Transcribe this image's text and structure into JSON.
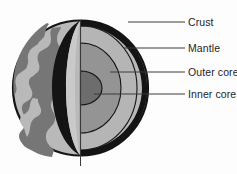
{
  "figure": {
    "background_color": "#fdfdfd"
  },
  "diagram": {
    "type": "labeled-cutaway-cross-section",
    "colors": {
      "outline": "#141414",
      "crust_band": "#141414",
      "surface": "#b9b9b9",
      "continents": "#767676",
      "cut_wall": "#c9c9c9",
      "mantle": "#b5b5b5",
      "outer_core": "#949494",
      "inner_core": "#6d6d6d",
      "leader_line": "#3a3a3a",
      "axis_line": "#3a3a3a"
    },
    "layers": [
      {
        "id": "crust",
        "name": "Crust",
        "fill": "#141414"
      },
      {
        "id": "mantle",
        "name": "Mantle",
        "fill": "#b5b5b5"
      },
      {
        "id": "outer_core",
        "name": "Outer core",
        "fill": "#949494"
      },
      {
        "id": "inner_core",
        "name": "Inner core",
        "fill": "#6d6d6d"
      }
    ]
  },
  "labels": {
    "crust": "Crust",
    "mantle": "Mantle",
    "outer_core": "Outer core",
    "inner_core": "Inner core"
  }
}
